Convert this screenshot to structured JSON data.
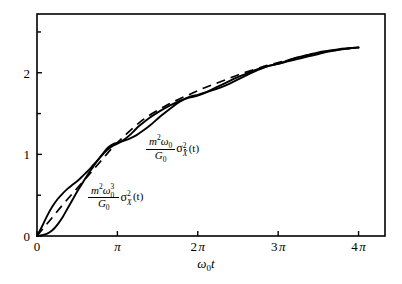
{
  "figure": {
    "background_color": "#ffffff",
    "line_color": "#000000"
  },
  "axes": {
    "x": {
      "label": "ω₀t",
      "label_parts": {
        "omega": "ω",
        "sub": "0",
        "t": "t"
      },
      "tick_labels": [
        "0",
        "π",
        "2 π",
        "3 π",
        "4 π"
      ],
      "tick_values": [
        0,
        3.14159,
        6.28319,
        9.42478,
        12.56637
      ],
      "range": [
        0,
        13.6
      ],
      "minor_ticks": false
    },
    "y": {
      "label": "",
      "tick_labels": [
        "0",
        "1",
        "2"
      ],
      "tick_values": [
        0,
        1,
        2
      ],
      "minor_tick_values": [
        0.5,
        1.5,
        2.5
      ],
      "range": [
        0,
        2.72
      ]
    }
  },
  "curve_labels": {
    "velocity": {
      "numerator_m": "m",
      "numerator_m_exp": "2",
      "numerator_omega": "ω",
      "numerator_omega_sub": "0",
      "denominator_G": "G",
      "denominator_G_sub": "0",
      "sigma": "σ",
      "sigma_exp": "2",
      "sigma_sub": "X",
      "sigma_sub_dot": true,
      "argument": "(t)",
      "plain": "m²ω₀/G₀ · σ²_Ẋ(t)"
    },
    "displacement": {
      "numerator_m": "m",
      "numerator_m_exp": "2",
      "numerator_omega": "ω",
      "numerator_omega_sub": "0",
      "numerator_omega_exp": "3",
      "denominator_G": "G",
      "denominator_G_sub": "0",
      "sigma": "σ",
      "sigma_exp": "2",
      "sigma_sub": "X",
      "sigma_sub_dot": false,
      "argument": "(t)",
      "plain": "m²ω₀³/G₀ · σ²_X(t)"
    }
  },
  "chart_data": {
    "type": "line",
    "title": "",
    "subtitle": "",
    "xlabel": "ω₀t",
    "ylabel": "",
    "xlim": [
      0,
      13.6
    ],
    "ylim": [
      0,
      2.72
    ],
    "grid": false,
    "legend_position": "inline-annotations",
    "xtick_labels": [
      "0",
      "π",
      "2 π",
      "3 π",
      "4 π"
    ],
    "xtick_values": [
      0,
      3.14159,
      6.28319,
      9.42478,
      12.56637
    ],
    "ytick_labels": [
      "0",
      "1",
      "2"
    ],
    "ytick_values": [
      0,
      1,
      2
    ],
    "annotations": [
      {
        "text": "m²ω₀/G₀ σ²_Ẋ(t)",
        "x": 3.3,
        "y": 1.05,
        "target_curve": "velocity_variance"
      },
      {
        "text": "m²ω₀³/G₀ σ²_X(t)",
        "x": 2.0,
        "y": 0.45,
        "target_curve": "displacement_variance"
      }
    ],
    "series": [
      {
        "name": "velocity_variance",
        "style": "solid",
        "description": "m^2*omega0/G0 * sigma^2_Xdot(t) — rises fast at first then oscillates about the mean trend",
        "x": [
          0.0,
          0.2,
          0.4,
          0.6,
          0.8,
          1.0,
          1.2,
          1.4,
          1.6,
          1.8,
          2.0,
          2.2,
          2.4,
          2.6,
          2.8,
          3.0,
          3.14159,
          3.4,
          3.6,
          3.8,
          4.0,
          4.4,
          4.8,
          5.2,
          5.6,
          6.0,
          6.28319,
          6.6,
          7.0,
          7.4,
          7.8,
          8.2,
          8.6,
          9.0,
          9.42478,
          9.8,
          10.2,
          10.6,
          11.0,
          11.4,
          11.8,
          12.2,
          12.56637
        ],
        "y": [
          0.0,
          0.12,
          0.25,
          0.36,
          0.45,
          0.52,
          0.58,
          0.63,
          0.68,
          0.74,
          0.8,
          0.87,
          0.94,
          1.01,
          1.07,
          1.11,
          1.13,
          1.18,
          1.23,
          1.29,
          1.35,
          1.45,
          1.53,
          1.6,
          1.66,
          1.7,
          1.72,
          1.76,
          1.82,
          1.88,
          1.94,
          1.99,
          2.04,
          2.08,
          2.11,
          2.15,
          2.19,
          2.22,
          2.25,
          2.27,
          2.29,
          2.3,
          2.31
        ]
      },
      {
        "name": "displacement_variance",
        "style": "solid",
        "description": "m^2*omega0^3/G0 * sigma^2_X(t) — starts flat at zero then oscillates in antiphase with the velocity curve",
        "x": [
          0.0,
          0.2,
          0.4,
          0.6,
          0.8,
          1.0,
          1.2,
          1.4,
          1.6,
          1.8,
          2.0,
          2.2,
          2.4,
          2.6,
          2.8,
          3.0,
          3.14159,
          3.4,
          3.6,
          3.8,
          4.0,
          4.4,
          4.8,
          5.2,
          5.6,
          6.0,
          6.28319,
          6.6,
          7.0,
          7.4,
          7.8,
          8.2,
          8.6,
          9.0,
          9.42478,
          9.8,
          10.2,
          10.6,
          11.0,
          11.4,
          11.8,
          12.2,
          12.56637
        ],
        "y": [
          0.0,
          0.01,
          0.03,
          0.07,
          0.14,
          0.23,
          0.34,
          0.45,
          0.56,
          0.66,
          0.76,
          0.85,
          0.94,
          1.02,
          1.09,
          1.13,
          1.14,
          1.17,
          1.19,
          1.22,
          1.26,
          1.35,
          1.46,
          1.56,
          1.65,
          1.71,
          1.73,
          1.76,
          1.8,
          1.85,
          1.91,
          1.97,
          2.03,
          2.08,
          2.11,
          2.14,
          2.17,
          2.2,
          2.23,
          2.26,
          2.28,
          2.3,
          2.31
        ]
      },
      {
        "name": "mean_trend",
        "style": "dashed",
        "description": "dashed asymptotic / averaged trend line that both variance curves oscillate about",
        "x": [
          0.0,
          0.5,
          1.0,
          1.5,
          2.0,
          2.5,
          3.0,
          3.5,
          4.0,
          4.5,
          5.0,
          5.5,
          6.0,
          6.5,
          7.0,
          7.5,
          8.0,
          8.5,
          9.0,
          9.5,
          10.0,
          10.5,
          11.0,
          11.5,
          12.0,
          12.56637
        ],
        "y": [
          0.0,
          0.19,
          0.38,
          0.56,
          0.74,
          0.92,
          1.1,
          1.25,
          1.39,
          1.5,
          1.59,
          1.67,
          1.74,
          1.81,
          1.87,
          1.93,
          1.99,
          2.04,
          2.09,
          2.13,
          2.17,
          2.21,
          2.24,
          2.27,
          2.29,
          2.31
        ]
      }
    ]
  }
}
